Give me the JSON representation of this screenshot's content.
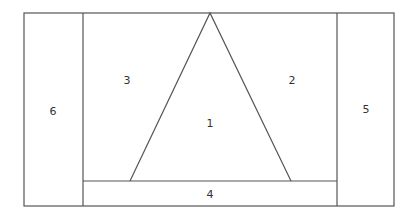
{
  "diagram": {
    "stroke_color": "#555555",
    "background": "#ffffff",
    "regions": [
      {
        "id": "1",
        "label": "1",
        "shape": "triangle",
        "label_x": 210,
        "label_y": 123
      },
      {
        "id": "2",
        "label": "2",
        "shape": "right-trapezoid-area",
        "label_x": 292,
        "label_y": 80
      },
      {
        "id": "3",
        "label": "3",
        "shape": "left-trapezoid-area",
        "label_x": 127,
        "label_y": 80
      },
      {
        "id": "4",
        "label": "4",
        "shape": "bottom-strip",
        "label_x": 210,
        "label_y": 194
      },
      {
        "id": "5",
        "label": "5",
        "shape": "right-column",
        "label_x": 366,
        "label_y": 109
      },
      {
        "id": "6",
        "label": "6",
        "shape": "left-column",
        "label_x": 53,
        "label_y": 111
      }
    ]
  }
}
